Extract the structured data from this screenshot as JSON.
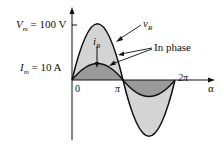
{
  "diagram": {
    "title": "",
    "labels": {
      "vm": "V",
      "vm_sub": "m",
      "vm_value": " = 100 V",
      "im": "I",
      "im_sub": "m",
      "im_value": " = 10 A",
      "origin": "0",
      "pi": "π",
      "two_pi": "2π",
      "alpha": "α",
      "v_curve": "v",
      "v_curve_sub": "R",
      "i_curve": "i",
      "i_curve_sub": "R",
      "annotation": "In phase"
    },
    "waveforms": [
      {
        "name": "v_R",
        "amplitude": 100,
        "unit": "V"
      },
      {
        "name": "i_R",
        "amplitude": 10,
        "unit": "A"
      }
    ],
    "colors": {
      "v_fill": "#d4d4d4",
      "i_fill": "#9a9a9a",
      "stroke": "#111111"
    }
  }
}
